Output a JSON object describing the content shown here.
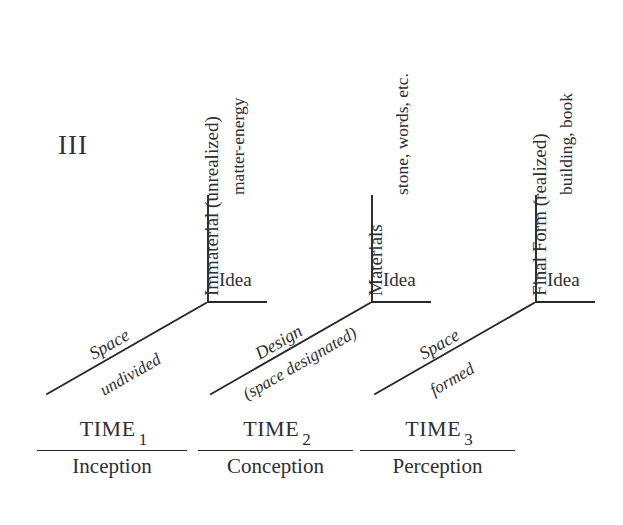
{
  "figure": {
    "plate_label": "III",
    "line_color": "#262626",
    "text_color": "#2f2f2f",
    "background": "#ffffff"
  },
  "groups": [
    {
      "id": "group-1",
      "vertical_axis_label": "Immaterial (unrealized)",
      "vertical_axis_sublabel": "matter-energy",
      "horizontal_axis_label": "Idea",
      "diagonal_axis_label": "Space",
      "diagonal_axis_sublabel": "undivided",
      "time_word": "TIME",
      "time_subscript": "1",
      "time_stage": "Inception"
    },
    {
      "id": "group-2",
      "vertical_axis_label": "Materials",
      "vertical_axis_sublabel": "stone, words, etc.",
      "horizontal_axis_label": "Idea",
      "diagonal_axis_label": "Design",
      "diagonal_axis_sublabel": "(space designated)",
      "time_word": "TIME",
      "time_subscript": "2",
      "time_stage": "Conception"
    },
    {
      "id": "group-3",
      "vertical_axis_label": "Final Form (realized)",
      "vertical_axis_sublabel": "building, book",
      "horizontal_axis_label": "Idea",
      "diagonal_axis_label": "Space",
      "diagonal_axis_sublabel": "formed",
      "time_word": "TIME",
      "time_subscript": "3",
      "time_stage": "Perception"
    }
  ]
}
